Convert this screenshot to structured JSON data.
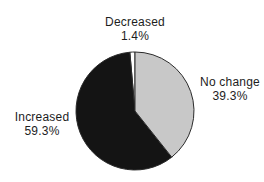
{
  "figure": {
    "background_color": "#ffffff",
    "text_color": "#1d1d1d"
  },
  "chart_data": {
    "type": "pie",
    "title": "",
    "legend": "none",
    "start_angle_deg": 0,
    "direction": "counterclockwise",
    "stroke_color": "#2b2b2b",
    "slices": [
      {
        "label": "Decreased",
        "value": 1.4,
        "percent_label": "1.4%",
        "color": "#ffffff",
        "label_position": "top"
      },
      {
        "label": "Increased",
        "value": 59.3,
        "percent_label": "59.3%",
        "color": "#141414",
        "label_position": "left"
      },
      {
        "label": "No change",
        "value": 39.3,
        "percent_label": "39.3%",
        "color": "#c8c8c8",
        "label_position": "right"
      }
    ]
  }
}
